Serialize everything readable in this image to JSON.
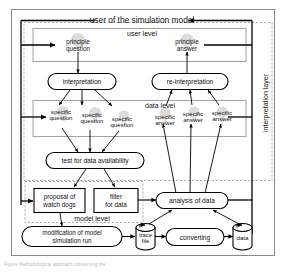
{
  "figure": {
    "title_top": "user of the simulation model",
    "layer_label": "interpretation layer",
    "levels": {
      "user": "user level",
      "data": "data level",
      "model": "model level"
    },
    "nodes": {
      "principle_question": "principle\nquestion",
      "principle_question_l1": "principle",
      "principle_question_l2": "question",
      "principle_answer_l1": "principle",
      "principle_answer_l2": "answer",
      "interpretation": "interpretation",
      "reinterpretation": "re-interpretation",
      "specific_question_1a": "specific",
      "specific_question_1b": "question",
      "specific_question_2a": "specific",
      "specific_question_2b": "question",
      "specific_question_3a": "specific",
      "specific_question_3b": "question",
      "specific_answer_1a": "specific",
      "specific_answer_1b": "answer",
      "specific_answer_2a": "specific",
      "specific_answer_2b": "answer",
      "specific_answer_3a": "specific",
      "specific_answer_3b": "answer",
      "test_for_data_availability": "test for data availability",
      "proposal_of_watch_dogs_l1": "proposal of",
      "proposal_of_watch_dogs_l2": "watch dogs",
      "filter_for_data_l1": "filter",
      "filter_for_data_l2": "for data",
      "analysis_of_data": "analysis of data",
      "modification_l1": "modification of model",
      "modification_l2": "simulation run",
      "trace_file_l1": "trace",
      "trace_file_l2": "file",
      "converting": "converting",
      "data_store": "data"
    },
    "caption": "Figure  Methodological approach  concerning the",
    "colors": {
      "stroke": "#000000",
      "frame": "#8a8a8a",
      "group_box": "#9a9a9a",
      "dashed": "#9a9a9a",
      "watermark": "#d8d8d8",
      "caption": "#b9b9b9",
      "background": "#ffffff"
    }
  }
}
